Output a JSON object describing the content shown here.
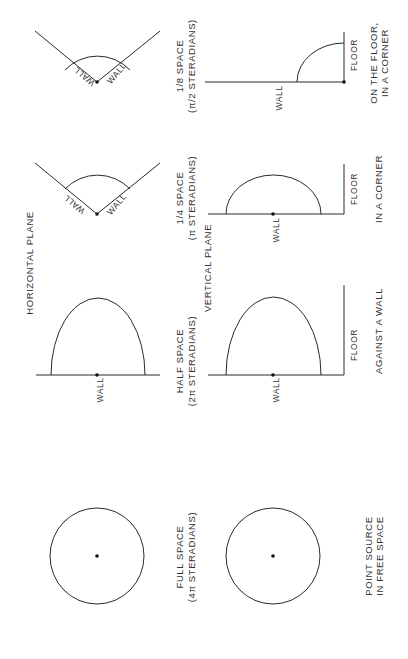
{
  "figure": {
    "sections": {
      "horizontal_plane": "HORIZONTAL PLANE",
      "vertical_plane": "VERTICAL PLANE"
    },
    "columns": [
      {
        "id": "eighth-space",
        "title": "1/8 SPACE",
        "subtitle": "(π/2 STERADIANS)",
        "horizontal_labels": [
          "WALL",
          "WALL"
        ],
        "vertical_labels": {
          "wall": "WALL",
          "floor": "FLOOR"
        },
        "caption_lines": [
          "ON THE FLOOR,",
          "IN A CORNER"
        ]
      },
      {
        "id": "quarter-space",
        "title": "1/4 SPACE",
        "subtitle": "(π STERADIANS)",
        "horizontal_labels": [
          "WALL",
          "WALL"
        ],
        "vertical_labels": {
          "wall": "WALL",
          "floor": "FLOOR"
        },
        "caption_lines": [
          "IN A CORNER"
        ]
      },
      {
        "id": "half-space",
        "title": "HALF SPACE",
        "subtitle": "(2π STERADIANS)",
        "horizontal_labels": [
          "WALL"
        ],
        "vertical_labels": {
          "wall": "WALL",
          "floor": "FLOOR"
        },
        "caption_lines": [
          "AGAINST A WALL"
        ]
      },
      {
        "id": "full-space",
        "title": "FULL SPACE",
        "subtitle": "(4π STERADIANS)",
        "horizontal_labels": [],
        "vertical_labels": {},
        "caption_lines": [
          "POINT SOURCE",
          "IN FREE SPACE"
        ]
      }
    ]
  }
}
